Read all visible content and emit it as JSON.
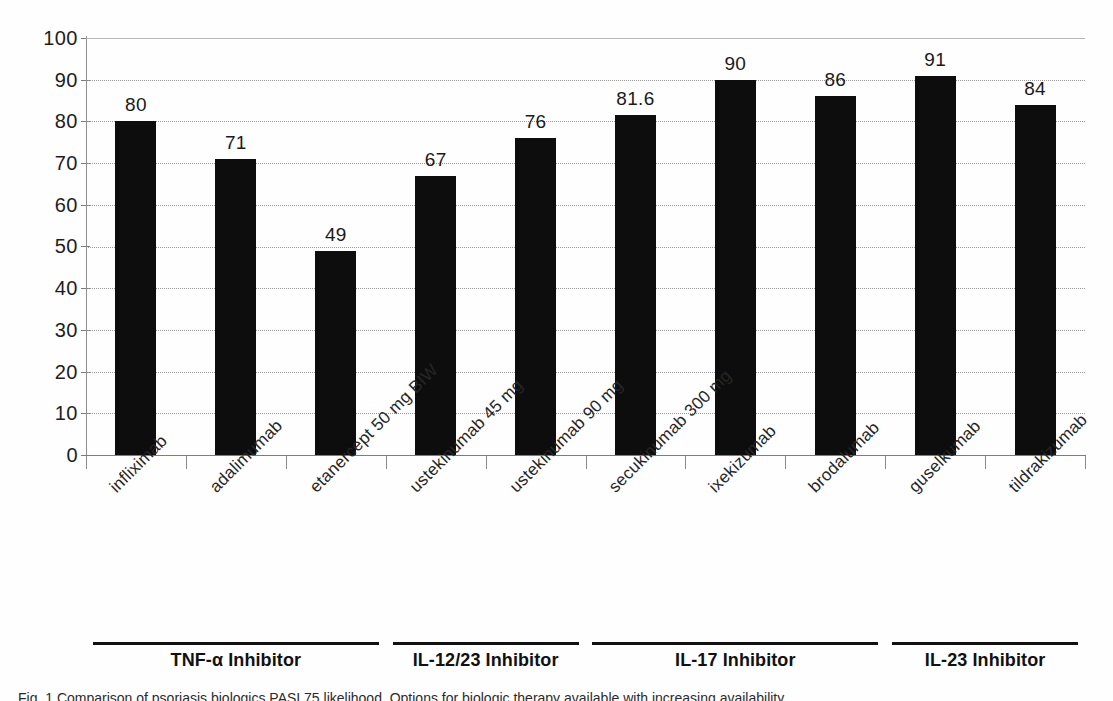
{
  "chart_data": {
    "type": "bar",
    "title": "",
    "subtitle": "",
    "xlabel": "",
    "ylabel": "",
    "ylim": [
      0,
      100
    ],
    "ytick_step": 10,
    "yticks": [
      "100",
      "90",
      "80",
      "70",
      "60",
      "50",
      "40",
      "30",
      "20",
      "10",
      "0"
    ],
    "grid": true,
    "grid_axis": "y",
    "legend": "none",
    "bar_color": "#0d0d0d",
    "categories": [
      "infliximab",
      "adalimumab",
      "etanercept 50 mg BIW",
      "ustekinumab 45 mg",
      "ustekinumab 90 mg",
      "secukinumab 300 mg",
      "ixekizumab",
      "brodalumab",
      "guselkumab",
      "tildrakizumab"
    ],
    "values": [
      80,
      71,
      49,
      67,
      76,
      81.6,
      90,
      86,
      91,
      84
    ],
    "data_labels": [
      "80",
      "71",
      "49",
      "67",
      "76",
      "81.6",
      "90",
      "86",
      "91",
      "84"
    ],
    "groups": [
      {
        "label": "TNF-α Inhibitor",
        "members": [
          "infliximab",
          "adalimumab",
          "etanercept 50 mg BIW"
        ]
      },
      {
        "label": "IL-12/23 Inhibitor",
        "members": [
          "ustekinumab 45 mg",
          "ustekinumab 90 mg"
        ]
      },
      {
        "label": "IL-17 Inhibitor",
        "members": [
          "secukinumab 300 mg",
          "ixekizumab",
          "brodalumab"
        ]
      },
      {
        "label": "IL-23 Inhibitor",
        "members": [
          "guselkumab",
          "tildrakizumab"
        ]
      }
    ]
  },
  "caption": {
    "text": "Fig. 1  Comparison of psoriasis biologics PASI 75 likelihood. Options for biologic therapy available with increasing availability"
  }
}
